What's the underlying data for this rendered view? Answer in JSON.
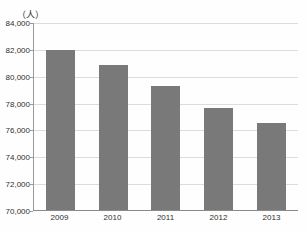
{
  "chart_data": {
    "type": "bar",
    "unit_label": "（人）",
    "categories": [
      "2009",
      "2010",
      "2011",
      "2012",
      "2013"
    ],
    "values": [
      82000,
      80850,
      79300,
      77650,
      76500
    ],
    "title": "",
    "xlabel": "",
    "ylabel": "（人）",
    "ylim": [
      70000,
      84000
    ],
    "ytick_step": 2000,
    "ytick_labels": [
      "84,000",
      "82,000",
      "80,000",
      "78,000",
      "76,000",
      "74,000",
      "72,000",
      "70,000"
    ],
    "grid": true,
    "legend_position": "none",
    "bar_color": "#797979",
    "gridline_color": "#dcdcdc",
    "axis_color": "#9a9a9a",
    "text_color": "#2e2e2e"
  }
}
